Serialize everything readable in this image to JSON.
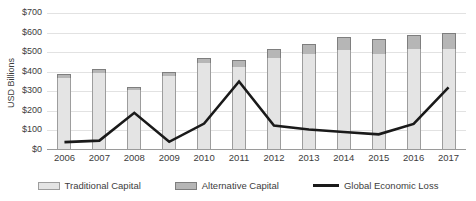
{
  "chart_data": {
    "type": "bar",
    "subtype": "stacked-bar-with-line",
    "title": "",
    "xlabel": "",
    "ylabel": "USD Billions",
    "ylim": [
      0,
      700
    ],
    "ytick_step": 100,
    "grid": true,
    "legend_position": "bottom",
    "categories": [
      "2006",
      "2007",
      "2008",
      "2009",
      "2010",
      "2011",
      "2012",
      "2013",
      "2014",
      "2015",
      "2016",
      "2017"
    ],
    "ytick_labels": [
      "$0",
      "$100",
      "$200",
      "$300",
      "$400",
      "$500",
      "$600",
      "$700"
    ],
    "ytick_values": [
      0,
      100,
      200,
      300,
      400,
      500,
      600,
      700
    ],
    "series": [
      {
        "name": "Traditional Capital",
        "type": "bar",
        "color": "#e4e4e4",
        "values": [
          370,
          392,
          305,
          378,
          447,
          425,
          470,
          490,
          511,
          493,
          514,
          516
        ]
      },
      {
        "name": "Alternative Capital",
        "type": "bar",
        "color": "#b6b6b6",
        "values": [
          17,
          22,
          19,
          22,
          24,
          34,
          44,
          50,
          64,
          72,
          75,
          82
        ]
      },
      {
        "name": "Global Economic Loss",
        "type": "line",
        "color": "#1a1a1a",
        "values": [
          40,
          48,
          190,
          42,
          135,
          350,
          125,
          105,
          92,
          80,
          133,
          320
        ]
      }
    ],
    "totals": [
      387,
      414,
      324,
      400,
      471,
      459,
      514,
      540,
      575,
      565,
      589,
      598
    ]
  },
  "legend": {
    "items": [
      {
        "label": "Traditional Capital",
        "marker": "swatch-light-gray"
      },
      {
        "label": "Alternative Capital",
        "marker": "swatch-dark-gray"
      },
      {
        "label": "Global Economic Loss",
        "marker": "line-black"
      }
    ]
  }
}
